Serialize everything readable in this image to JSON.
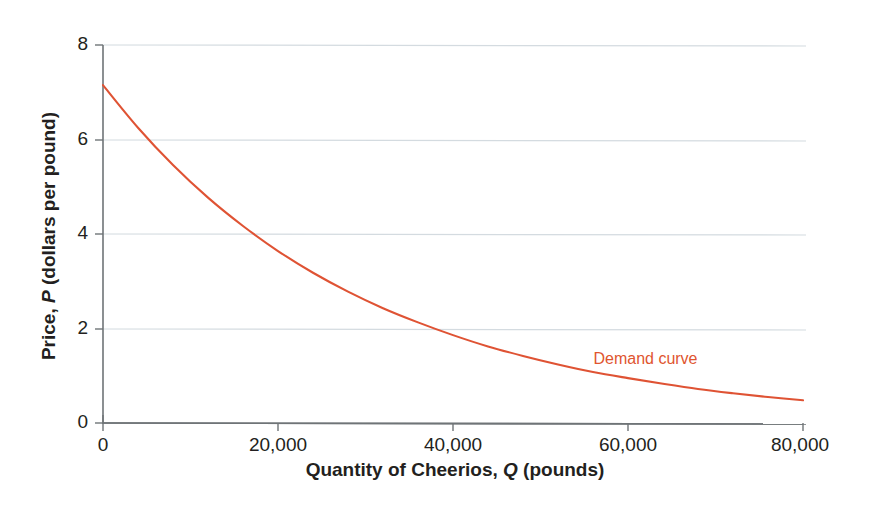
{
  "chart_data": {
    "type": "line",
    "title": "",
    "subtitle": "",
    "xlabel_plain": "Quantity of Cheerios, Q (pounds)",
    "xlabel_parts": {
      "pre": "Quantity of Cheerios, ",
      "italic": "Q",
      "post": " (pounds)"
    },
    "ylabel_plain": "Price, P (dollars per pound)",
    "ylabel_parts": {
      "pre": "Price, ",
      "italic": "P",
      "post": " (dollars per pound)"
    },
    "xlim": [
      0,
      80000
    ],
    "ylim": [
      0,
      8
    ],
    "xticks": [
      0,
      20000,
      40000,
      60000,
      80000
    ],
    "xtick_labels": [
      "0",
      "20,000",
      "40,000",
      "60,000",
      "80,000"
    ],
    "yticks": [
      0,
      2,
      4,
      6,
      8
    ],
    "ytick_labels": [
      "0",
      "2",
      "4",
      "6",
      "8"
    ],
    "grid": "horizontal",
    "legend": "none",
    "annotations": [
      {
        "text": "Demand curve",
        "x": 62000,
        "y": 1.25,
        "color": "#e0552f"
      }
    ],
    "series": [
      {
        "name": "Demand curve",
        "color": "#df5334",
        "x": [
          0,
          4000,
          8000,
          12000,
          16000,
          20000,
          24000,
          28000,
          32000,
          36000,
          40000,
          44000,
          48000,
          52000,
          56000,
          60000,
          64000,
          68000,
          72000,
          76000,
          80000
        ],
        "y": [
          7.15,
          6.25,
          5.46,
          4.77,
          4.17,
          3.64,
          3.18,
          2.78,
          2.43,
          2.13,
          1.86,
          1.62,
          1.42,
          1.24,
          1.08,
          0.95,
          0.83,
          0.72,
          0.63,
          0.55,
          0.48
        ]
      }
    ]
  },
  "colors": {
    "curve": "#df5334",
    "annotation": "#e0552f",
    "grid": "#d4dbe0",
    "axis": "#6f7477",
    "text": "#231f20",
    "background": "#ffffff"
  }
}
